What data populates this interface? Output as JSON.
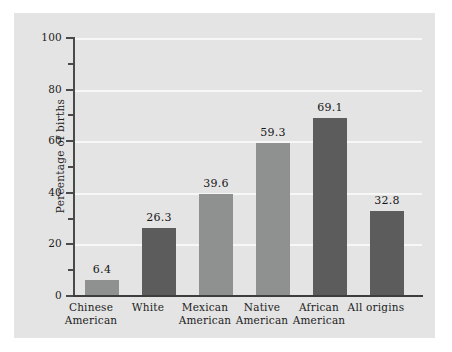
{
  "chart_data": {
    "type": "bar",
    "title": "",
    "subtitle": "",
    "xlabel": "",
    "ylabel": "Percentage of births",
    "ylim": [
      0,
      100
    ],
    "xlim": null,
    "grid": "horizontal-major-only",
    "legend": "none",
    "y_major_ticks": [
      0,
      20,
      40,
      60,
      80,
      100
    ],
    "y_minor_ticks": [
      10,
      30,
      50,
      70,
      90
    ],
    "y_tick_labels": [
      "0",
      "20",
      "40",
      "60",
      "80",
      "100"
    ],
    "value_label_format": "one-decimal",
    "categories": [
      "Chinese American",
      "White",
      "Mexican American",
      "Native American",
      "African American",
      "All origins"
    ],
    "category_lines": [
      [
        "Chinese",
        "American"
      ],
      [
        "White",
        ""
      ],
      [
        "Mexican",
        "American"
      ],
      [
        "Native",
        "American"
      ],
      [
        "African",
        "American"
      ],
      [
        "All origins",
        ""
      ]
    ],
    "values": [
      6.4,
      26.3,
      39.6,
      59.3,
      69.1,
      32.8
    ],
    "value_labels": [
      "6.4",
      "26.3",
      "39.6",
      "59.3",
      "69.1",
      "32.8"
    ],
    "bar_shades": [
      "light",
      "dark",
      "light",
      "light",
      "dark",
      "dark"
    ]
  },
  "colors": {
    "figure_background": "#ffffff",
    "panel_background": "#e4e4e4",
    "gridline": "#f7f7f7",
    "axis_line": "#4a4a4a",
    "bar_light": "#8f9090",
    "bar_dark": "#5c5c5c",
    "text": "#1c1c1c"
  }
}
